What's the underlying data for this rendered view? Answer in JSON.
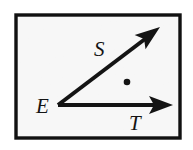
{
  "figure": {
    "kind": "geometry-angle-diagram",
    "frame": {
      "border_color": "#111111",
      "border_width_px": 4,
      "fill_color": "#f4f4f4",
      "outer_background": "#ffffff",
      "x": 14,
      "y": 13,
      "width": 168,
      "height": 127
    },
    "ink_color": "#141414",
    "vertex": {
      "name": "E",
      "label": "E",
      "x": 58,
      "y": 105,
      "label_x": 36,
      "label_y": 113
    },
    "rays": [
      {
        "name": "ray-ES",
        "label": "S",
        "from_x": 58,
        "from_y": 105,
        "to_x": 160,
        "to_y": 27,
        "label_x": 94,
        "label_y": 56,
        "stroke_width": 4,
        "arrowhead": "solid-triangle"
      },
      {
        "name": "ray-ET",
        "label": "T",
        "from_x": 58,
        "from_y": 105,
        "to_x": 173,
        "to_y": 105,
        "label_x": 129,
        "label_y": 130,
        "stroke_width": 4,
        "arrowhead": "solid-triangle"
      }
    ],
    "interior_point": {
      "name": "interior-point",
      "x": 127,
      "y": 82,
      "radius": 3.2,
      "fill": "#141414"
    },
    "labels": {
      "vertex": "E",
      "upper_ray": "S",
      "lower_ray": "T"
    }
  }
}
